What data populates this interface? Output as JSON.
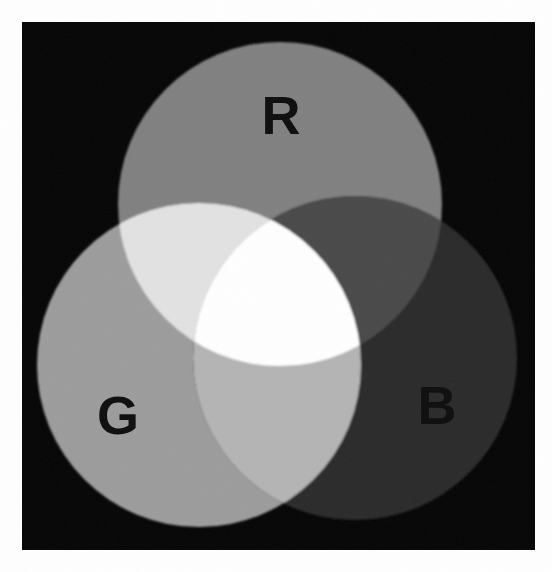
{
  "figure": {
    "canvas": {
      "width": 552,
      "height": 572,
      "background": "#ffffff"
    },
    "plate": {
      "name": "black-plate",
      "x": 22,
      "y": 22,
      "width": 513,
      "height": 528,
      "color": "#050505"
    }
  },
  "labels": {
    "red": "R",
    "green": "G",
    "blue": "B"
  },
  "circles": [
    {
      "key": "red",
      "label": "R",
      "cx": 280,
      "cy": 204,
      "r": 162,
      "color": "#808080",
      "label_x": 281,
      "label_y": 115,
      "label_size": 54
    },
    {
      "key": "green",
      "label": "G",
      "cx": 199,
      "cy": 365,
      "r": 162,
      "color": "#9c9c9c",
      "label_x": 118,
      "label_y": 415,
      "label_size": 54
    },
    {
      "key": "blue",
      "label": "B",
      "cx": 355,
      "cy": 358,
      "r": 162,
      "color": "#2a2a2a",
      "label_x": 437,
      "label_y": 405,
      "label_size": 54
    }
  ],
  "overlaps": [
    {
      "key": "red-green",
      "name": "yellow-region",
      "color": "#e2e2e2"
    },
    {
      "key": "red-blue",
      "name": "magenta-region",
      "color": "#4a4a4a"
    },
    {
      "key": "green-blue",
      "name": "cyan-region",
      "color": "#b4b4b4"
    },
    {
      "key": "red-green-blue",
      "name": "white-region",
      "color": "#ffffff"
    }
  ],
  "chart_data": {
    "type": "pie",
    "xlabel": "",
    "ylabel": "",
    "categories": [
      "R only",
      "G only",
      "B only",
      "R ∩ G (yellow)",
      "R ∩ B (magenta)",
      "G ∩ B (cyan)",
      "R ∩ G ∩ B (white)",
      "background"
    ],
    "values": [
      128,
      156,
      42,
      226,
      74,
      180,
      255,
      5
    ],
    "series": [
      {
        "name": "grayscale luminance (0-255)",
        "values": [
          128,
          156,
          42,
          226,
          74,
          180,
          255,
          5
        ]
      }
    ],
    "swatches": [
      "#808080",
      "#9c9c9c",
      "#2a2a2a",
      "#e2e2e2",
      "#4a4a4a",
      "#b4b4b4",
      "#ffffff",
      "#050505"
    ],
    "legend": [
      "R",
      "G",
      "B"
    ],
    "legend_position": "in-figure",
    "grid": false,
    "ylim": [
      0,
      255
    ]
  }
}
